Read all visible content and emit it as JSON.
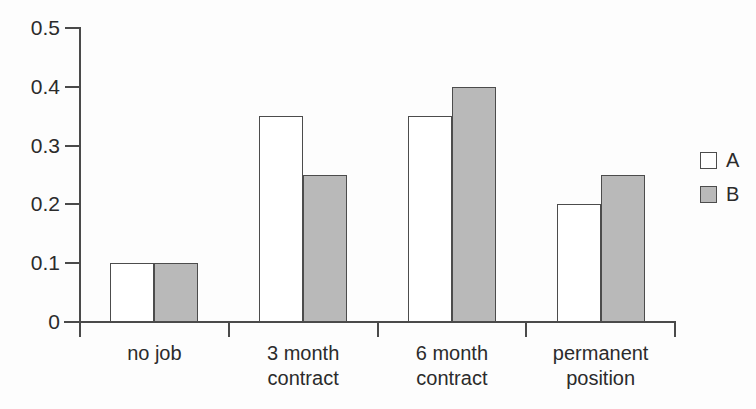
{
  "chart_data": {
    "type": "bar",
    "title": "",
    "subtitle": "",
    "xlabel": "",
    "ylabel": "",
    "categories": [
      "no job",
      "3 month contract",
      "6 month contract",
      "permanent position"
    ],
    "category_lines": [
      [
        "no job"
      ],
      [
        "3 month",
        "contract"
      ],
      [
        "6 month",
        "contract"
      ],
      [
        "permanent",
        "position"
      ]
    ],
    "series": [
      {
        "name": "A",
        "values": [
          0.1,
          0.35,
          0.35,
          0.2
        ],
        "color": "#ffffff"
      },
      {
        "name": "B",
        "values": [
          0.1,
          0.25,
          0.4,
          0.25
        ],
        "color": "#b9b9b9"
      }
    ],
    "ylim": [
      0,
      0.5
    ],
    "yticks": [
      0,
      0.1,
      0.2,
      0.3,
      0.4,
      0.5
    ],
    "ytick_labels": [
      "0",
      "0.1",
      "0.2",
      "0.3",
      "0.4",
      "0.5"
    ],
    "grid": false,
    "legend_position": "right",
    "legend_entries": [
      {
        "label": "A",
        "swatch": "open-square"
      },
      {
        "label": "B",
        "swatch": "filled-square"
      }
    ],
    "axis_color": "#4a4a4a",
    "bar_outline_color": "#4c4c4c",
    "background": "#fdfdfd"
  }
}
